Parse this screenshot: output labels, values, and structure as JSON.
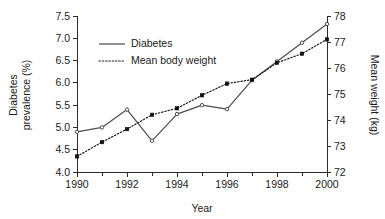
{
  "chart_data": {
    "type": "line",
    "title": "",
    "subtitle": "",
    "xlabel": "Year",
    "ylabel": "Diabetes prevalence (%)",
    "ylabel_line1": "Diabetes",
    "ylabel_line2": "prevalence (%)",
    "y2label": "Mean weight (kg)",
    "x": [
      1990,
      1991,
      1992,
      1993,
      1994,
      1995,
      1996,
      1997,
      1998,
      1999,
      2000
    ],
    "xlim": [
      1990,
      2000
    ],
    "ylim": [
      4.0,
      7.5
    ],
    "y2lim": [
      72,
      78
    ],
    "grid": false,
    "legend_position": "top-left",
    "xticks_major": [
      "1990",
      "1992",
      "1994",
      "1996",
      "1998",
      "2000"
    ],
    "xticks_major_values": [
      1990,
      1992,
      1994,
      1996,
      1998,
      2000
    ],
    "xticks_minor_values": [
      1991,
      1993,
      1995,
      1997,
      1999
    ],
    "yticks": [
      "4.0",
      "4.5",
      "5.0",
      "5.5",
      "6.0",
      "6.5",
      "7.0",
      "7.5"
    ],
    "yticks_values": [
      4.0,
      4.5,
      5.0,
      5.5,
      6.0,
      6.5,
      7.0,
      7.5
    ],
    "y2ticks": [
      "72",
      "73",
      "74",
      "75",
      "76",
      "77",
      "78"
    ],
    "y2ticks_values": [
      72,
      73,
      74,
      75,
      76,
      77,
      78
    ],
    "series": [
      {
        "name": "Diabetes",
        "axis": "left",
        "style": "solid",
        "marker": "open-circle",
        "color": "#4c4c4c",
        "values": [
          4.9,
          5.0,
          5.4,
          4.7,
          5.3,
          5.5,
          5.41,
          6.06,
          6.48,
          6.9,
          7.32
        ]
      },
      {
        "name": "Mean body weight",
        "axis": "right",
        "style": "dotted",
        "marker": "filled-square",
        "color": "#1a1a1a",
        "values": [
          72.6,
          73.15,
          73.65,
          74.2,
          74.45,
          74.95,
          75.4,
          75.55,
          76.2,
          76.55,
          77.1
        ]
      }
    ],
    "legend": [
      {
        "label": "Diabetes",
        "style": "solid",
        "color": "#4c4c4c"
      },
      {
        "label": "Mean body weight",
        "style": "dotted",
        "color": "#1a1a1a"
      }
    ]
  }
}
